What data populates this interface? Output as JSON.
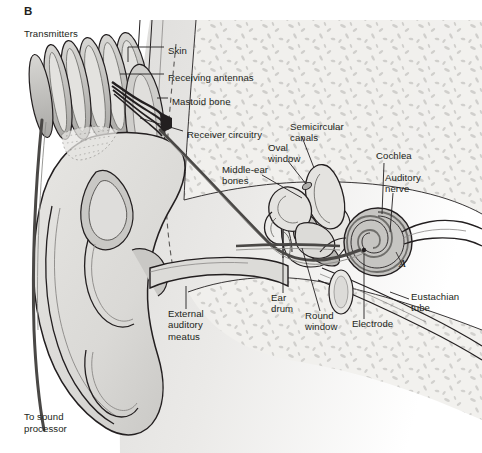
{
  "figure": {
    "panel_label": "B",
    "title_note": "Transmitters",
    "bottom_note_line1": "To sound",
    "bottom_note_line2": "processor",
    "region_marker": "A"
  },
  "colors": {
    "outline": "#231f20",
    "text": "#231f20",
    "skin_light": "#e8e7e4",
    "skin_mid": "#d3d2cf",
    "skin_shadow": "#bdbcb9",
    "cartilage": "#b6b5b2",
    "bone_fill": "#f0efec",
    "bone_speckle": "#c9c8c5",
    "coil_fill": "#c4c3c0",
    "coil_rim": "#8f8e8b",
    "cochlea_fill": "#bfbebb",
    "canal_fill": "#dcdbd8",
    "wire": "#4a4846",
    "page_bg": "#ffffff"
  },
  "labels": [
    {
      "id": "skin",
      "text": "Skin",
      "x": 168,
      "y": 50,
      "align": "left"
    },
    {
      "id": "receiving-antennas",
      "text": "Receiving antennas",
      "x": 168,
      "y": 77,
      "align": "left"
    },
    {
      "id": "mastoid-bone",
      "text": "Mastoid bone",
      "x": 172,
      "y": 101,
      "align": "left"
    },
    {
      "id": "receiver-circuitry",
      "text": "Receiver circuitry",
      "x": 187,
      "y": 134,
      "align": "left"
    },
    {
      "id": "semicircular-canals",
      "text": "Semicircular\ncanals",
      "x": 290,
      "y": 126,
      "align": "left"
    },
    {
      "id": "oval-window",
      "text": "Oval\nwindow",
      "x": 268,
      "y": 147,
      "align": "left"
    },
    {
      "id": "cochlea",
      "text": "Cochlea",
      "x": 376,
      "y": 155,
      "align": "left"
    },
    {
      "id": "auditory-nerve",
      "text": "Auditory\nnerve",
      "x": 385,
      "y": 177,
      "align": "left"
    },
    {
      "id": "middle-ear-bones",
      "text": "Middle-ear\nbones",
      "x": 222,
      "y": 169,
      "align": "left"
    },
    {
      "id": "external-auditory-meatus",
      "text": "External\nauditory\nmeatus",
      "x": 168,
      "y": 313,
      "align": "left"
    },
    {
      "id": "ear-drum",
      "text": "Ear\ndrum",
      "x": 271,
      "y": 297,
      "align": "left"
    },
    {
      "id": "round-window",
      "text": "Round\nwindow",
      "x": 305,
      "y": 315,
      "align": "left"
    },
    {
      "id": "electrode",
      "text": "Electrode",
      "x": 352,
      "y": 323,
      "align": "left"
    },
    {
      "id": "eustachian-tube",
      "text": "Eustachian\ntube",
      "x": 411,
      "y": 296,
      "align": "left"
    }
  ],
  "leader_lines": [
    {
      "id": "skin",
      "points": "164,53 124,53 124,66"
    },
    {
      "id": "receiving-antennas",
      "points": "164,80 122,80"
    },
    {
      "id": "mastoid-bone",
      "points": "168,104 159,104"
    },
    {
      "id": "receiver-circuitry",
      "points": "183,137 139,121"
    },
    {
      "id": "semicircular-canals",
      "points": "300,140 312,166"
    },
    {
      "id": "oval-window",
      "points": "286,164 305,184"
    },
    {
      "id": "cochlea",
      "points": "388,166 385,218"
    },
    {
      "id": "auditory-nerve",
      "points": "396,196 390,234"
    },
    {
      "id": "middle-ear-bones",
      "points": "258,178 300,200"
    },
    {
      "id": "external-auditory-meatus",
      "points": "186,308 186,286"
    },
    {
      "id": "ear-drum",
      "points": "283,292 283,259"
    },
    {
      "id": "round-window",
      "points": "320,310 300,244"
    },
    {
      "id": "electrode",
      "points": "364,318 364,258"
    },
    {
      "id": "eustachian-tube",
      "points": "407,300 388,292"
    }
  ]
}
